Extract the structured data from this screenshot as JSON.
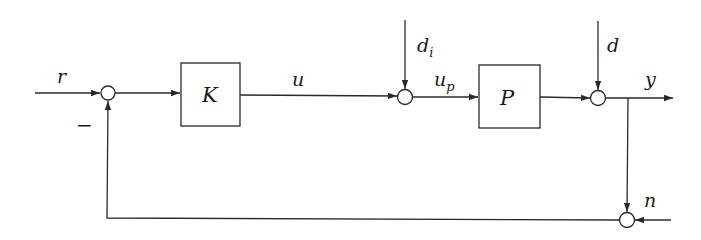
{
  "diagram": {
    "type": "feedback-control-block-diagram",
    "blocks": [
      {
        "id": "K",
        "label": "K",
        "role": "controller"
      },
      {
        "id": "P",
        "label": "P",
        "role": "plant"
      }
    ],
    "summing_junctions": [
      {
        "id": "sum-error",
        "inputs": [
          "r",
          "feedback"
        ],
        "signs": [
          "+",
          "−"
        ]
      },
      {
        "id": "sum-input-disturbance",
        "inputs": [
          "u",
          "d_i"
        ]
      },
      {
        "id": "sum-output-disturbance",
        "inputs": [
          "P output",
          "d"
        ]
      },
      {
        "id": "sum-noise",
        "inputs": [
          "y",
          "n"
        ]
      }
    ],
    "signals": {
      "r": "r",
      "u": "u",
      "u_p_base": "u",
      "u_p_sub": "p",
      "d_i_base": "d",
      "d_i_sub": "i",
      "d": "d",
      "y": "y",
      "n": "n"
    },
    "feedback_sign": "−"
  }
}
